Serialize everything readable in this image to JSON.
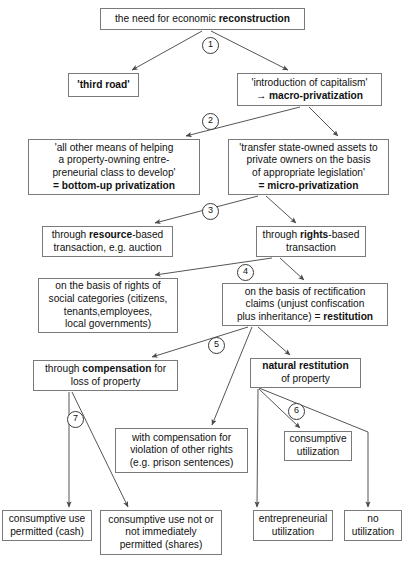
{
  "diagram": {
    "line_color": "#555555",
    "box_border_color": "#7a7a7a",
    "background": "#ffffff",
    "nodes": [
      {
        "id": "n1",
        "name": "node-need-for-reconstruction",
        "x": 100,
        "y": 8,
        "w": 205,
        "h": 22,
        "lines": [
          [
            {
              "t": "the need for economic ",
              "b": false
            },
            {
              "t": "reconstruction",
              "b": true
            }
          ]
        ]
      },
      {
        "id": "n2",
        "name": "node-third-road",
        "x": 68,
        "y": 73,
        "w": 71,
        "h": 24,
        "lines": [
          [
            {
              "t": "'third road'",
              "b": true
            }
          ]
        ]
      },
      {
        "id": "n3",
        "name": "node-introduction-of-capitalism",
        "x": 237,
        "y": 73,
        "w": 145,
        "h": 33,
        "lines": [
          [
            {
              "t": "'introduction of capitalism'",
              "b": false
            }
          ],
          [
            {
              "t": "→ ",
              "b": true
            },
            {
              "t": "macro-privatization",
              "b": true
            }
          ]
        ]
      },
      {
        "id": "n4",
        "name": "node-bottom-up-privatization",
        "x": 28,
        "y": 139,
        "w": 172,
        "h": 56,
        "lines": [
          [
            {
              "t": "'all other means of helping",
              "b": false
            }
          ],
          [
            {
              "t": "a property-owning entre-",
              "b": false
            }
          ],
          [
            {
              "t": "preneurial class to develop'",
              "b": false
            }
          ],
          [
            {
              "t": "= ",
              "b": true
            },
            {
              "t": "bottom-up privatization",
              "b": true
            }
          ]
        ]
      },
      {
        "id": "n5",
        "name": "node-micro-privatization",
        "x": 228,
        "y": 139,
        "w": 161,
        "h": 56,
        "lines": [
          [
            {
              "t": "'transfer state-owned assets to",
              "b": false
            }
          ],
          [
            {
              "t": "private owners on the basis",
              "b": false
            }
          ],
          [
            {
              "t": "of appropriate legislation'",
              "b": false
            }
          ],
          [
            {
              "t": "= ",
              "b": true
            },
            {
              "t": "micro-privatization",
              "b": true
            }
          ]
        ]
      },
      {
        "id": "n6",
        "name": "node-resource-based-transaction",
        "x": 42,
        "y": 226,
        "w": 131,
        "h": 31,
        "lines": [
          [
            {
              "t": "through ",
              "b": false
            },
            {
              "t": "resource",
              "b": true
            },
            {
              "t": "-based",
              "b": false
            }
          ],
          [
            {
              "t": "transaction, e.g. auction",
              "b": false
            }
          ]
        ]
      },
      {
        "id": "n7",
        "name": "node-rights-based-transaction",
        "x": 256,
        "y": 226,
        "w": 110,
        "h": 31,
        "lines": [
          [
            {
              "t": "through ",
              "b": false
            },
            {
              "t": "rights",
              "b": true
            },
            {
              "t": "-based",
              "b": false
            }
          ],
          [
            {
              "t": "transaction",
              "b": false
            }
          ]
        ]
      },
      {
        "id": "n8",
        "name": "node-rights-of-social-categories",
        "x": 38,
        "y": 278,
        "w": 140,
        "h": 55,
        "lines": [
          [
            {
              "t": "on the basis of rights of",
              "b": false
            }
          ],
          [
            {
              "t": "social categories (citizens,",
              "b": false
            }
          ],
          [
            {
              "t": "tenants,employees,",
              "b": false
            }
          ],
          [
            {
              "t": "local governments)",
              "b": false
            }
          ]
        ]
      },
      {
        "id": "n9",
        "name": "node-restitution",
        "x": 222,
        "y": 283,
        "w": 166,
        "h": 43,
        "lines": [
          [
            {
              "t": "on the basis of rectification",
              "b": false
            }
          ],
          [
            {
              "t": "claims (unjust confiscation",
              "b": false
            }
          ],
          [
            {
              "t": "plus inheritance) = ",
              "b": false
            },
            {
              "t": "restitution",
              "b": true
            }
          ]
        ]
      },
      {
        "id": "n10",
        "name": "node-through-compensation",
        "x": 33,
        "y": 360,
        "w": 145,
        "h": 31,
        "lines": [
          [
            {
              "t": "through ",
              "b": false
            },
            {
              "t": "compensation",
              "b": true
            },
            {
              "t": " for",
              "b": false
            }
          ],
          [
            {
              "t": "loss of property",
              "b": false
            }
          ]
        ]
      },
      {
        "id": "n11",
        "name": "node-natural-restitution",
        "x": 250,
        "y": 358,
        "w": 111,
        "h": 30,
        "lines": [
          [
            {
              "t": "natural restitution",
              "b": true
            }
          ],
          [
            {
              "t": "of property",
              "b": false
            }
          ]
        ]
      },
      {
        "id": "n12",
        "name": "node-compensation-other-rights",
        "x": 115,
        "y": 428,
        "w": 133,
        "h": 45,
        "lines": [
          [
            {
              "t": "with compensation for",
              "b": false
            }
          ],
          [
            {
              "t": "violation of other rights",
              "b": false
            }
          ],
          [
            {
              "t": "(e.g. prison sentences)",
              "b": false
            }
          ]
        ]
      },
      {
        "id": "n13",
        "name": "node-consumptive-utilization",
        "x": 284,
        "y": 431,
        "w": 68,
        "h": 30,
        "lines": [
          [
            {
              "t": "consumptive",
              "b": false
            }
          ],
          [
            {
              "t": "utilization",
              "b": false
            }
          ]
        ]
      },
      {
        "id": "n14",
        "name": "node-consumptive-use-permitted",
        "x": 2,
        "y": 510,
        "w": 90,
        "h": 31,
        "lines": [
          [
            {
              "t": "consumptive use",
              "b": false
            }
          ],
          [
            {
              "t": "permitted (cash)",
              "b": false
            }
          ]
        ]
      },
      {
        "id": "n15",
        "name": "node-consumptive-use-not-permitted",
        "x": 100,
        "y": 510,
        "w": 122,
        "h": 45,
        "lines": [
          [
            {
              "t": "consumptive use not or",
              "b": false
            }
          ],
          [
            {
              "t": "not immediately",
              "b": false
            }
          ],
          [
            {
              "t": "permitted (shares)",
              "b": false
            }
          ]
        ]
      },
      {
        "id": "n16",
        "name": "node-entrepreneurial-utilization",
        "x": 253,
        "y": 510,
        "w": 80,
        "h": 31,
        "lines": [
          [
            {
              "t": "entrepreneurial",
              "b": false
            }
          ],
          [
            {
              "t": "utilization",
              "b": false
            }
          ]
        ]
      },
      {
        "id": "n17",
        "name": "node-no-utilization",
        "x": 344,
        "y": 510,
        "w": 58,
        "h": 31,
        "lines": [
          [
            {
              "t": "no",
              "b": false
            }
          ],
          [
            {
              "t": "utilization",
              "b": false
            }
          ]
        ]
      }
    ],
    "markers": [
      {
        "id": "m1",
        "name": "step-marker-1",
        "label": "1",
        "x": 202,
        "y": 37
      },
      {
        "id": "m2",
        "name": "step-marker-2",
        "label": "2",
        "x": 202,
        "y": 113
      },
      {
        "id": "m3",
        "name": "step-marker-3",
        "label": "3",
        "x": 202,
        "y": 203
      },
      {
        "id": "m4",
        "name": "step-marker-4",
        "label": "4",
        "x": 237,
        "y": 264
      },
      {
        "id": "m5",
        "name": "step-marker-5",
        "label": "5",
        "x": 208,
        "y": 337
      },
      {
        "id": "m6",
        "name": "step-marker-6",
        "label": "6",
        "x": 288,
        "y": 403
      },
      {
        "id": "m7",
        "name": "step-marker-7",
        "label": "7",
        "x": 67,
        "y": 411
      }
    ],
    "edges": [
      {
        "name": "edge-need-to-third-road",
        "x1": 202,
        "y1": 31,
        "x2": 132,
        "y2": 70
      },
      {
        "name": "edge-need-to-capitalism",
        "x1": 211,
        "y1": 31,
        "x2": 288,
        "y2": 70
      },
      {
        "name": "edge-capitalism-to-bottom-up",
        "x1": 300,
        "y1": 107,
        "x2": 186,
        "y2": 136
      },
      {
        "name": "edge-capitalism-to-micro",
        "x1": 309,
        "y1": 107,
        "x2": 338,
        "y2": 136
      },
      {
        "name": "edge-micro-to-resource",
        "x1": 258,
        "y1": 196,
        "x2": 155,
        "y2": 223
      },
      {
        "name": "edge-micro-to-rights",
        "x1": 266,
        "y1": 196,
        "x2": 296,
        "y2": 223
      },
      {
        "name": "edge-rights-to-social",
        "x1": 272,
        "y1": 258,
        "x2": 155,
        "y2": 275
      },
      {
        "name": "edge-rights-to-restitution",
        "x1": 280,
        "y1": 258,
        "x2": 304,
        "y2": 280
      },
      {
        "name": "edge-restitution-to-compensation",
        "x1": 248,
        "y1": 327,
        "x2": 152,
        "y2": 357
      },
      {
        "name": "edge-restitution-to-other-rights",
        "x1": 252,
        "y1": 327,
        "x2": 212,
        "y2": 425
      },
      {
        "name": "edge-restitution-to-natural",
        "x1": 258,
        "y1": 327,
        "x2": 290,
        "y2": 355
      },
      {
        "name": "edge-compensation-to-use-permitted",
        "x1": 69,
        "y1": 392,
        "x2": 69,
        "y2": 507
      },
      {
        "name": "edge-compensation-to-use-not-permitted",
        "x1": 72,
        "y1": 392,
        "x2": 128,
        "y2": 507
      },
      {
        "name": "edge-natural-to-consumptive",
        "x1": 259,
        "y1": 389,
        "x2": 300,
        "y2": 428
      },
      {
        "name": "edge-natural-to-entrepreneurial",
        "x1": 258,
        "y1": 389,
        "x2": 257,
        "y2": 507
      },
      {
        "name": "edge-natural-to-no-utilization",
        "x1": 259,
        "y1": 388,
        "x2": 368,
        "y2": 507,
        "bend": [
          368,
          432
        ]
      }
    ]
  }
}
